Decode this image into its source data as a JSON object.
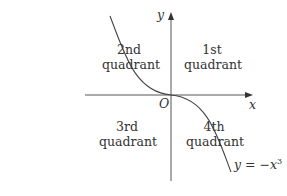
{
  "axes": {
    "x_label": "x",
    "y_label": "y",
    "origin_label": "O"
  },
  "quadrants": [
    {
      "line1": "2nd",
      "line2": "quadrant"
    },
    {
      "line1": "1st",
      "line2": "quadrant"
    },
    {
      "line1": "3rd",
      "line2": "quadrant"
    },
    {
      "line1": "4th",
      "line2": "quadrant"
    }
  ],
  "curve": {
    "equation_lhs": "y",
    "equation_op": "=",
    "equation_rhs": "−x",
    "exponent": "3",
    "color": "#444444"
  }
}
